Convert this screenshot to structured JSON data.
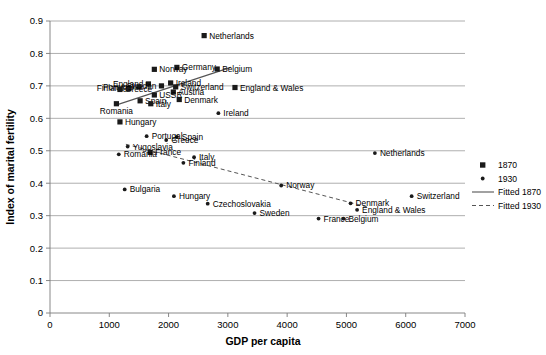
{
  "chart_data": {
    "type": "scatter",
    "title": "",
    "xlabel": "GDP per capita",
    "ylabel": "Index of marital fertility",
    "xlim": [
      0,
      7000
    ],
    "ylim": [
      0,
      0.9
    ],
    "xticks": [
      "0",
      "1000",
      "2000",
      "3000",
      "4000",
      "5000",
      "6000",
      "7000"
    ],
    "xtick_values": [
      0,
      1000,
      2000,
      3000,
      4000,
      5000,
      6000,
      7000
    ],
    "yticks": [
      "0",
      "0.1",
      "0.2",
      "0.3",
      "0.4",
      "0.5",
      "0.6",
      "0.7",
      "0.8",
      "0.9"
    ],
    "ytick_values": [
      0,
      0.1,
      0.2,
      0.3,
      0.4,
      0.5,
      0.6,
      0.7,
      0.8,
      0.9
    ],
    "grid": "horizontal",
    "legend_position": "right",
    "series": [
      {
        "name": "1870",
        "marker": "square",
        "points": [
          {
            "label": "Netherlands",
            "x": 2600,
            "y": 0.855,
            "label_pos": "right"
          },
          {
            "label": "Germany",
            "x": 2140,
            "y": 0.757,
            "label_pos": "right"
          },
          {
            "label": "Belgium",
            "x": 2820,
            "y": 0.752,
            "label_pos": "right"
          },
          {
            "label": "Norway",
            "x": 1760,
            "y": 0.751,
            "label_pos": "right"
          },
          {
            "label": "Ireland",
            "x": 2035,
            "y": 0.709,
            "label_pos": "right"
          },
          {
            "label": "England",
            "x": 1660,
            "y": 0.706,
            "label_pos": "left"
          },
          {
            "label": "Sweden",
            "x": 1880,
            "y": 0.7,
            "label_pos": "left"
          },
          {
            "label": "Switzerland",
            "x": 2120,
            "y": 0.697,
            "label_pos": "right"
          },
          {
            "label": "England & Wales",
            "x": 3120,
            "y": 0.695,
            "label_pos": "right"
          },
          {
            "label": "Portugal",
            "x": 1500,
            "y": 0.697,
            "label_pos": "left"
          },
          {
            "label": "Finland",
            "x": 1330,
            "y": 0.692,
            "label_pos": "left"
          },
          {
            "label": "Greece",
            "x": 1180,
            "y": 0.689,
            "label_pos": "right"
          },
          {
            "label": "Austria",
            "x": 2080,
            "y": 0.681,
            "label_pos": "right"
          },
          {
            "label": "USSR",
            "x": 1760,
            "y": 0.672,
            "label_pos": "right"
          },
          {
            "label": "Denmark",
            "x": 2180,
            "y": 0.658,
            "label_pos": "right"
          },
          {
            "label": "Spain",
            "x": 1520,
            "y": 0.654,
            "label_pos": "right"
          },
          {
            "label": "Italy",
            "x": 1700,
            "y": 0.645,
            "label_pos": "right"
          },
          {
            "label": "Romania",
            "x": 1120,
            "y": 0.645,
            "label_pos": "below"
          },
          {
            "label": "Hungary",
            "x": 1180,
            "y": 0.589,
            "label_pos": "right"
          },
          {
            "label": "France",
            "x": 1690,
            "y": 0.495,
            "label_pos": "right"
          }
        ]
      },
      {
        "name": "1930",
        "marker": "dot",
        "points": [
          {
            "label": "Netherlands",
            "x": 5480,
            "y": 0.493,
            "label_pos": "right"
          },
          {
            "label": "Ireland",
            "x": 2840,
            "y": 0.616,
            "label_pos": "right"
          },
          {
            "label": "Spain",
            "x": 2140,
            "y": 0.543,
            "label_pos": "right"
          },
          {
            "label": "Portugal",
            "x": 1630,
            "y": 0.545,
            "label_pos": "right"
          },
          {
            "label": "Greece",
            "x": 1960,
            "y": 0.533,
            "label_pos": "right"
          },
          {
            "label": "Yugoslavia",
            "x": 1310,
            "y": 0.513,
            "label_pos": "right"
          },
          {
            "label": "Romania",
            "x": 1160,
            "y": 0.489,
            "label_pos": "right"
          },
          {
            "label": "Italy",
            "x": 2430,
            "y": 0.48,
            "label_pos": "right"
          },
          {
            "label": "Finland",
            "x": 2250,
            "y": 0.463,
            "label_pos": "right"
          },
          {
            "label": "Norway",
            "x": 3900,
            "y": 0.393,
            "label_pos": "right"
          },
          {
            "label": "Bulgaria",
            "x": 1260,
            "y": 0.381,
            "label_pos": "right"
          },
          {
            "label": "Hungary",
            "x": 2090,
            "y": 0.36,
            "label_pos": "right"
          },
          {
            "label": "Czechoslovakia",
            "x": 2660,
            "y": 0.337,
            "label_pos": "right"
          },
          {
            "label": "Denmark",
            "x": 5070,
            "y": 0.338,
            "label_pos": "right"
          },
          {
            "label": "Switzerland",
            "x": 6100,
            "y": 0.36,
            "label_pos": "right"
          },
          {
            "label": "England & Wales",
            "x": 5180,
            "y": 0.318,
            "label_pos": "right"
          },
          {
            "label": "Sweden",
            "x": 3450,
            "y": 0.308,
            "label_pos": "right"
          },
          {
            "label": "France",
            "x": 4530,
            "y": 0.291,
            "label_pos": "right"
          },
          {
            "label": "Belgium",
            "x": 4950,
            "y": 0.291,
            "label_pos": "right"
          }
        ]
      }
    ],
    "fits": [
      {
        "name": "Fitted 1870",
        "style": "solid",
        "x0": 1100,
        "y0": 0.64,
        "x1": 3050,
        "y1": 0.757
      },
      {
        "name": "Fitted 1930",
        "style": "dashed",
        "x0": 1280,
        "y0": 0.52,
        "x1": 5350,
        "y1": 0.327
      }
    ],
    "legend": [
      {
        "label": "1870",
        "kind": "square"
      },
      {
        "label": "1930",
        "kind": "dot"
      },
      {
        "label": "Fitted 1870",
        "kind": "solid-line"
      },
      {
        "label": "Fitted 1930",
        "kind": "dashed-line"
      }
    ]
  }
}
